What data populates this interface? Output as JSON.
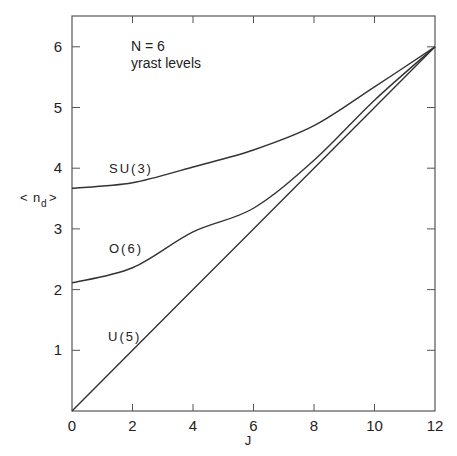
{
  "chart_data": {
    "type": "line",
    "title": "",
    "xlabel": "J",
    "ylabel": "< n_d >",
    "xlim": [
      0,
      12
    ],
    "ylim": [
      0,
      6.5
    ],
    "xticks": [
      0,
      2,
      4,
      6,
      8,
      10,
      12
    ],
    "yticks": [
      1,
      2,
      3,
      4,
      5,
      6
    ],
    "grid": false,
    "legend": "inline labels on curves",
    "annotations": [
      "N = 6",
      "yrast levels"
    ],
    "x": [
      0,
      2,
      4,
      6,
      8,
      10,
      12
    ],
    "series": [
      {
        "name": "SU(3)",
        "values": [
          3.67,
          3.76,
          4.02,
          4.3,
          4.7,
          5.34,
          6.0
        ]
      },
      {
        "name": "O(6)",
        "values": [
          2.11,
          2.36,
          2.95,
          3.34,
          4.13,
          5.12,
          6.0
        ]
      },
      {
        "name": "U(5)",
        "values": [
          0,
          1,
          2,
          3,
          4,
          5,
          6
        ]
      }
    ]
  },
  "labels": {
    "annot_line1": "N = 6",
    "annot_line2": "yrast levels",
    "su3": "SU(3)",
    "o6": "O(6)",
    "u5": "U(5)",
    "xlabel": "J",
    "ylabel_left": "<",
    "ylabel_n": "n",
    "ylabel_sub": "d",
    "ylabel_right": ">"
  },
  "colors": {
    "line": "#333333",
    "axis": "#555555",
    "background": "#ffffff"
  }
}
